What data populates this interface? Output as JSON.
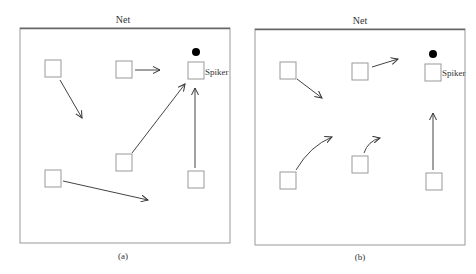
{
  "figure": {
    "panels": [
      {
        "id": "a",
        "caption": "(a)",
        "net_label": "Net",
        "spiker_label": "Spiker",
        "movement": "straight arrows"
      },
      {
        "id": "b",
        "caption": "(b)",
        "net_label": "Net",
        "spiker_label": "Spiker",
        "movement": "curved arrows"
      }
    ]
  }
}
